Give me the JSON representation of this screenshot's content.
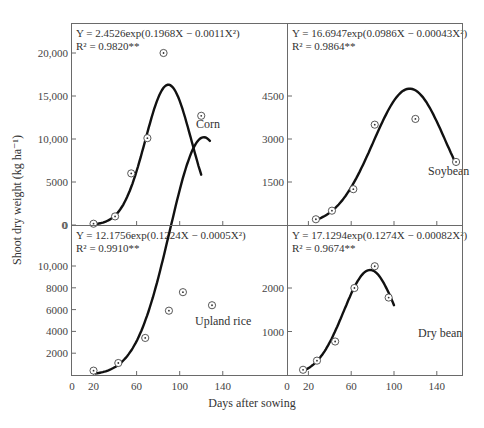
{
  "figure": {
    "ylabel": "Shoot dry weight (kg ha⁻¹)",
    "xlabel": "Days after sowing"
  },
  "chart_data": [
    {
      "type": "scatter",
      "panel": "top-left",
      "crop": "Corn",
      "equation": "Y = 2.4526exp(0.1968X − 0.0011X²)",
      "r2": "R² = 0.9820**",
      "xlabel": "Days after sowing",
      "ylabel": "Shoot dry weight (kg ha-1)",
      "yticks": [
        0,
        5000,
        10000,
        15000,
        20000
      ],
      "ytick_labels": [
        "0",
        "5000",
        "10,000",
        "15,000",
        "20,000"
      ],
      "xlim": [
        0,
        160
      ],
      "ylim": [
        0,
        23000
      ],
      "x": [
        20,
        40,
        55,
        70,
        85,
        120
      ],
      "y": [
        150,
        1000,
        6000,
        10100,
        20000,
        12700
      ],
      "fit": {
        "a": 2.4526,
        "b": 0.1968,
        "c": 0.0011,
        "x_range": [
          20,
          120
        ]
      }
    },
    {
      "type": "scatter",
      "panel": "top-right",
      "crop": "Soybean",
      "equation": "Y = 16.6947exp(0.0986X − 0.00043X²)",
      "r2": "R² = 0.9864**",
      "xlabel": "Days after sowing",
      "ylabel": "Shoot dry weight (kg ha-1)",
      "yticks": [
        1500,
        3000,
        4500
      ],
      "ytick_labels": [
        "1500",
        "3000",
        "4500"
      ],
      "xlim": [
        0,
        160
      ],
      "ylim": [
        0,
        7000
      ],
      "x": [
        27,
        42,
        62,
        82,
        120,
        158
      ],
      "y": [
        200,
        500,
        1250,
        3500,
        3700,
        2200
      ],
      "fit": {
        "a": 16.6947,
        "b": 0.0986,
        "c": 0.00043,
        "x_range": [
          27,
          158
        ]
      }
    },
    {
      "type": "scatter",
      "panel": "bottom-left",
      "crop": "Upland rice",
      "equation": "Y = 12.1756exp(0.1224X − 0.0005X²)",
      "r2": "R² = 0.9910**",
      "xlabel": "Days after sowing",
      "ylabel": "Shoot dry weight (kg ha-1)",
      "xticks": [
        0,
        20,
        60,
        100,
        140
      ],
      "yticks": [
        2000,
        4000,
        6000,
        8000,
        10000
      ],
      "ytick_labels": [
        "2000",
        "4000",
        "6000",
        "8000",
        "10,000"
      ],
      "xlim": [
        0,
        160
      ],
      "ylim": [
        0,
        14000
      ],
      "x": [
        20,
        43,
        68,
        90,
        103,
        130
      ],
      "y": [
        400,
        1100,
        3400,
        5900,
        7600,
        6400
      ],
      "fit": {
        "a": 12.1756,
        "b": 0.1224,
        "c": 0.0005,
        "x_range": [
          22,
          128
        ]
      }
    },
    {
      "type": "scatter",
      "panel": "bottom-right",
      "crop": "Dry bean",
      "equation": "Y = 17.1294exp(0.1274X − 0.00082X²)",
      "r2": "R² = 0.9674**",
      "xlabel": "Days after sowing",
      "ylabel": "Shoot dry weight (kg ha-1)",
      "xticks": [
        0,
        20,
        60,
        100,
        140
      ],
      "yticks": [
        1000,
        2000
      ],
      "ytick_labels": [
        "1000",
        "2000"
      ],
      "xlim": [
        0,
        160
      ],
      "ylim": [
        0,
        3400
      ],
      "x": [
        15,
        28,
        45,
        63,
        82,
        95
      ],
      "y": [
        120,
        330,
        770,
        2000,
        2500,
        1780
      ],
      "fit": {
        "a": 17.1294,
        "b": 0.1274,
        "c": 0.00082,
        "x_range": [
          15,
          100
        ]
      }
    }
  ],
  "axes": {
    "x_tick_labels": [
      "0",
      "20",
      "60",
      "100",
      "140"
    ]
  }
}
